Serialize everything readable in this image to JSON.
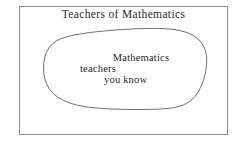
{
  "diagram": {
    "type": "venn-subset",
    "universe": {
      "label": "Teachers of Mathematics",
      "shape": "rectangle",
      "stroke_color": "#8d8d8d",
      "fill_color": "#ffffff",
      "bounds": {
        "x": 19,
        "y": 6,
        "width": 209,
        "height": 129
      }
    },
    "subset": {
      "shape": "blob",
      "stroke_color": "#6f6f6f",
      "fill_color": "#ffffff",
      "label_lines": [
        "Mathematics",
        "teachers",
        "you know"
      ]
    },
    "background_color": "#ffffff",
    "text_color": "#1f1f1f"
  }
}
